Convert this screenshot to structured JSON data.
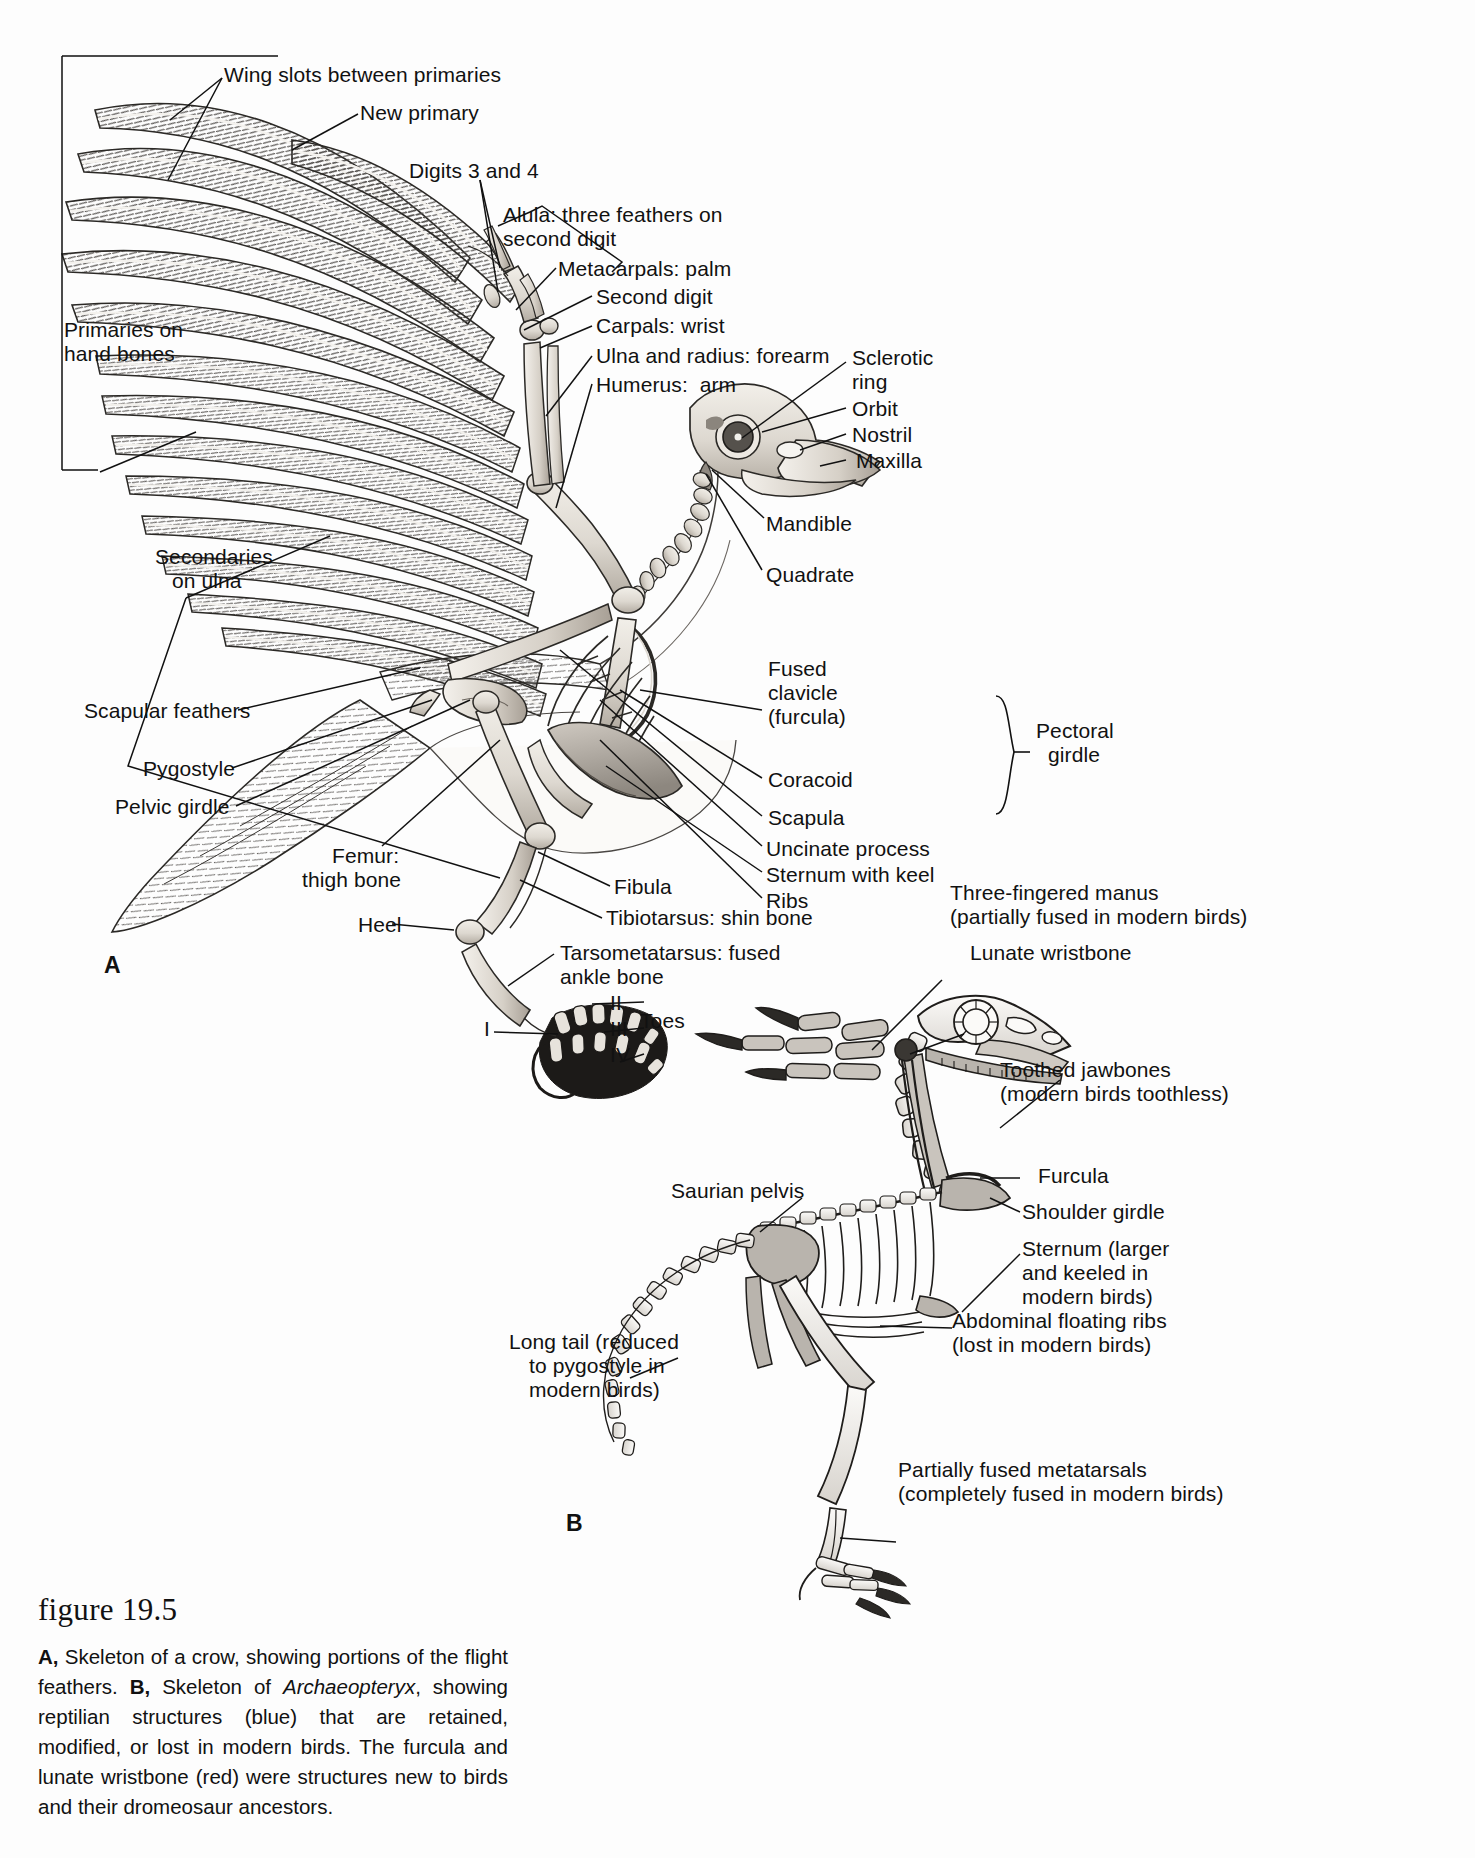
{
  "figure": {
    "number": "19.5",
    "title_word": "figure",
    "caption_parts": {
      "a_tag": "A,",
      "a_text": " Skeleton of a crow, showing portions of the flight feathers. ",
      "b_tag": "B,",
      "b_text_1": " Skeleton of ",
      "b_italic": "Archaeopteryx",
      "b_text_2": ", showing reptilian structures (blue) that are retained, modified, or lost in modern birds. The furcula and lunate wristbone (red) were structures new to birds and their dromeosaur ancestors."
    }
  },
  "panels": {
    "a_letter": "A",
    "b_letter": "B"
  },
  "panel_a_labels": {
    "wing_slots": "Wing slots between primaries",
    "new_primary": "New primary",
    "digits_3_4": "Digits 3 and 4",
    "alula_line1": "Alula: three feathers on",
    "alula_line2": "second digit",
    "metacarpals": "Metacarpals: palm",
    "second_digit": "Second digit",
    "carpals": "Carpals: wrist",
    "ulna_radius": "Ulna and radius: forearm",
    "humerus": "Humerus:  arm",
    "primaries_line1": "Primaries on",
    "primaries_line2": "hand bones",
    "secondaries_line1": "Secondaries",
    "secondaries_line2": "on ulna",
    "scapular_feathers": "Scapular feathers",
    "pygostyle": "Pygostyle",
    "pelvic_girdle": "Pelvic girdle",
    "femur_line1": "Femur:",
    "femur_line2": "thigh bone",
    "heel": "Heel",
    "tarsometatarsus_line1": "Tarsometatarsus: fused",
    "tarsometatarsus_line2": "ankle bone",
    "fibula": "Fibula",
    "tibiotarsus": "Tibiotarsus: shin bone",
    "sclerotic_line1": "Sclerotic",
    "sclerotic_line2": "ring",
    "orbit": "Orbit",
    "nostril": "Nostril",
    "maxilla": "Maxilla",
    "mandible": "Mandible",
    "quadrate": "Quadrate",
    "fused_clavicle_line1": "Fused",
    "fused_clavicle_line2": "clavicle",
    "fused_clavicle_line3": "(furcula)",
    "coracoid": "Coracoid",
    "scapula": "Scapula",
    "pectoral_line1": "Pectoral",
    "pectoral_line2": "girdle",
    "uncinate": "Uncinate process",
    "sternum_keel": "Sternum with keel",
    "ribs": "Ribs",
    "toe_i": "I",
    "toe_ii": "II",
    "toe_iii": "III",
    "toe_iv": "IV",
    "toes": "Toes"
  },
  "panel_b_labels": {
    "manus_line1": "Three-fingered manus",
    "manus_line2": "(partially fused in modern birds)",
    "lunate": "Lunate wristbone",
    "toothed_line1": "Toothed jawbones",
    "toothed_line2": "(modern birds toothless)",
    "furcula": "Furcula",
    "shoulder_girdle": "Shoulder girdle",
    "sternum_line1": "Sternum (larger",
    "sternum_line2": "and keeled in",
    "sternum_line3": "modern birds)",
    "abdominal_line1": "Abdominal floating ribs",
    "abdominal_line2": "(lost in modern birds)",
    "metatarsals_line1": "Partially fused metatarsals",
    "metatarsals_line2": "(completely fused in modern birds)",
    "saurian_pelvis": "Saurian pelvis",
    "long_tail_line1": "Long tail (reduced",
    "long_tail_line2": "to pygostyle in",
    "long_tail_line3": "modern birds)"
  },
  "colors": {
    "ink": "#111111",
    "bone_light": "#e8e4de",
    "bone_mid": "#c9c3bb",
    "bone_shadow": "#9e978d",
    "feather_dark": "#4a4744",
    "feather_mid": "#7d7975",
    "page_bg": "#fdfdfd",
    "blue_structure": "#b9bfc4",
    "red_structure": "#b0aaa6"
  }
}
